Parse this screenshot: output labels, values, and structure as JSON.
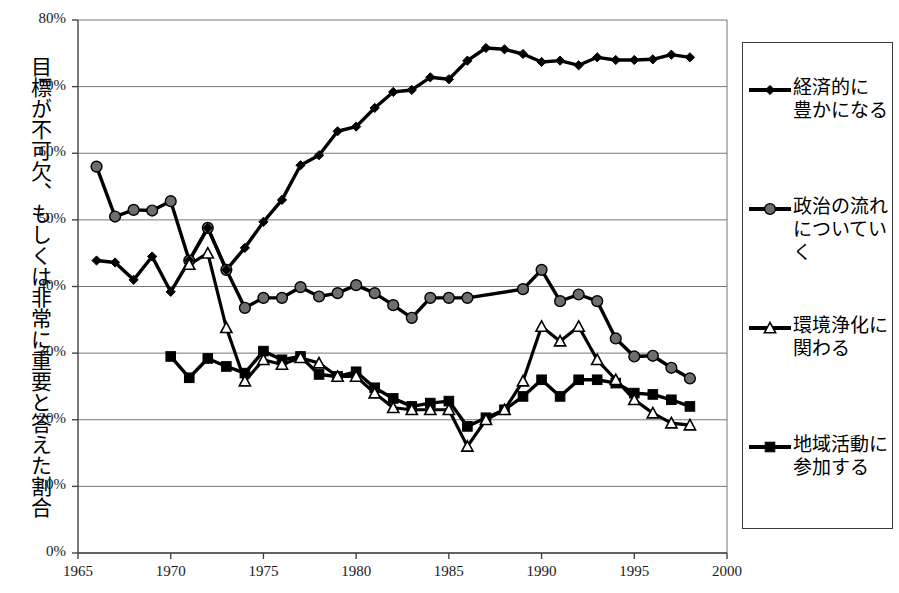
{
  "chart_data": {
    "type": "line",
    "title": "",
    "xlabel": "",
    "ylabel": "目標が不可欠、もしくは非常に重要と答えた割合",
    "xlim": [
      1965,
      2000
    ],
    "ylim": [
      0,
      80
    ],
    "xticks": [
      "1965",
      "1970",
      "1975",
      "1980",
      "1985",
      "1990",
      "1995",
      "2000"
    ],
    "yticks": [
      "0%",
      "10%",
      "20%",
      "30%",
      "40%",
      "50%",
      "60%",
      "70%",
      "80%"
    ],
    "grid": "horizontal",
    "legend_position": "right-outside",
    "series": [
      {
        "name": "経済的に\n豊かになる",
        "marker": "diamond",
        "color": "#000000",
        "x": [
          1966,
          1967,
          1968,
          1969,
          1970,
          1971,
          1972,
          1973,
          1974,
          1975,
          1976,
          1977,
          1978,
          1979,
          1980,
          1981,
          1982,
          1983,
          1984,
          1985,
          1986,
          1987,
          1988,
          1989,
          1990,
          1991,
          1992,
          1993,
          1994,
          1995,
          1996,
          1997,
          1998
        ],
        "values": [
          43.9,
          43.6,
          41.0,
          44.5,
          39.2,
          43.9,
          48.8,
          42.5,
          45.8,
          49.7,
          53.0,
          58.2,
          59.7,
          63.3,
          64.0,
          66.8,
          69.2,
          69.5,
          71.4,
          71.1,
          73.9,
          75.8,
          75.6,
          74.9,
          73.7,
          73.9,
          73.2,
          74.4,
          74.0,
          74.0,
          74.1,
          74.8,
          74.4
        ]
      },
      {
        "name": "政治の流れ\nについていく",
        "marker": "circle",
        "color": "#6e6e6e",
        "x": [
          1966,
          1967,
          1968,
          1969,
          1970,
          1971,
          1972,
          1973,
          1974,
          1975,
          1976,
          1977,
          1978,
          1979,
          1980,
          1981,
          1982,
          1983,
          1984,
          1985,
          1986,
          1989,
          1990,
          1991,
          1992,
          1993,
          1994,
          1995,
          1996,
          1997,
          1998
        ],
        "values": [
          58.0,
          50.5,
          51.5,
          51.4,
          52.8,
          43.9,
          48.8,
          42.5,
          36.8,
          38.3,
          38.3,
          39.9,
          38.5,
          39.0,
          40.2,
          39.0,
          37.2,
          35.3,
          38.3,
          38.3,
          38.3,
          39.6,
          42.5,
          37.8,
          38.8,
          37.8,
          32.2,
          29.5,
          29.6,
          27.8,
          26.2
        ]
      },
      {
        "name": "環境浄化に\n関わる",
        "marker": "triangle",
        "color": "#ffffff",
        "x": [
          1971,
          1972,
          1973,
          1974,
          1975,
          1976,
          1977,
          1978,
          1979,
          1980,
          1981,
          1982,
          1983,
          1984,
          1985,
          1986,
          1987,
          1988,
          1989,
          1990,
          1991,
          1992,
          1993,
          1994,
          1995,
          1996,
          1997,
          1998
        ],
        "values": [
          43.3,
          45.0,
          33.8,
          25.8,
          29.0,
          28.3,
          29.3,
          28.5,
          26.5,
          26.5,
          24.0,
          21.8,
          21.5,
          21.5,
          21.5,
          16.0,
          20.0,
          21.5,
          25.8,
          34.0,
          31.8,
          34.0,
          29.0,
          26.0,
          23.0,
          21.0,
          19.5,
          19.2
        ]
      },
      {
        "name": "地域活動に\n参加する",
        "marker": "square",
        "color": "#000000",
        "x": [
          1970,
          1971,
          1972,
          1973,
          1974,
          1975,
          1976,
          1977,
          1978,
          1979,
          1980,
          1981,
          1982,
          1983,
          1984,
          1985,
          1986,
          1987,
          1988,
          1989,
          1990,
          1991,
          1992,
          1993,
          1994,
          1995,
          1996,
          1997,
          1998
        ],
        "values": [
          29.5,
          26.3,
          29.2,
          28.0,
          27.0,
          30.3,
          29.0,
          29.5,
          26.8,
          26.5,
          27.2,
          24.8,
          23.2,
          22.0,
          22.5,
          22.8,
          19.0,
          20.3,
          21.5,
          23.5,
          26.0,
          23.5,
          26.0,
          26.0,
          25.5,
          24.0,
          23.8,
          23.0,
          22.0
        ]
      }
    ]
  },
  "axis": {
    "y_label_text": "目標が不可欠、もしくは非常に重要と答えた割合"
  },
  "legend": {
    "items": [
      {
        "label": "経済的に\n豊かになる",
        "marker": "diamond"
      },
      {
        "label": "政治の流れ\nについていく",
        "marker": "circle"
      },
      {
        "label": "環境浄化に\n関わる",
        "marker": "triangle"
      },
      {
        "label": "地域活動に\n参加する",
        "marker": "square"
      }
    ]
  }
}
